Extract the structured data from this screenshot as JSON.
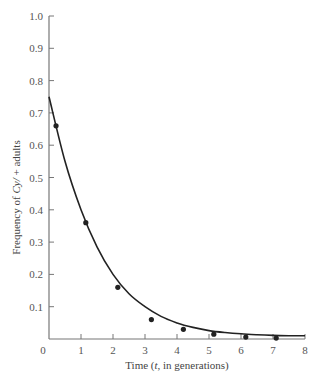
{
  "chart_data": {
    "type": "scatter",
    "title": "",
    "xlabel": "Time (t, in generations)",
    "xlabel_parts": [
      "Time (",
      "t",
      ", in generations)"
    ],
    "ylabel": "Frequency of Cy/+ adults",
    "ylabel_parts": [
      "Frequency of ",
      "Cy/",
      " + adults"
    ],
    "xlim": [
      0,
      8
    ],
    "ylim": [
      0,
      1.0
    ],
    "x_ticks": [
      0,
      1,
      2,
      3,
      4,
      5,
      6,
      7,
      8
    ],
    "x_tick_labels": [
      "0",
      "1",
      "2",
      "3",
      "4",
      "5",
      "6",
      "7",
      "8"
    ],
    "y_ticks": [
      0.1,
      0.2,
      0.3,
      0.4,
      0.5,
      0.6,
      0.7,
      0.8,
      0.9,
      1.0
    ],
    "y_tick_labels": [
      "0.1",
      "0.2",
      "0.3",
      "0.4",
      "0.5",
      "0.6",
      "0.7",
      "0.8",
      "0.9",
      "1.0"
    ],
    "grid": false,
    "legend": null,
    "series": [
      {
        "name": "Observed",
        "kind": "points",
        "x": [
          0.22,
          1.15,
          2.15,
          3.2,
          4.2,
          5.15,
          6.15,
          7.1
        ],
        "y": [
          0.66,
          0.36,
          0.16,
          0.06,
          0.03,
          0.015,
          0.006,
          0.003
        ]
      },
      {
        "name": "Fitted curve",
        "kind": "line",
        "x": [
          0,
          0.5,
          1,
          1.5,
          2,
          2.5,
          3,
          3.5,
          4,
          4.5,
          5,
          5.5,
          6,
          6.5,
          7,
          7.5,
          8
        ],
        "y": [
          0.75,
          0.55,
          0.4,
          0.285,
          0.2,
          0.14,
          0.1,
          0.07,
          0.05,
          0.036,
          0.026,
          0.02,
          0.016,
          0.013,
          0.011,
          0.01,
          0.01
        ]
      }
    ]
  },
  "colors": {
    "axis": "#777777",
    "curve": "#222222",
    "points": "#222222",
    "text": "#555555"
  }
}
